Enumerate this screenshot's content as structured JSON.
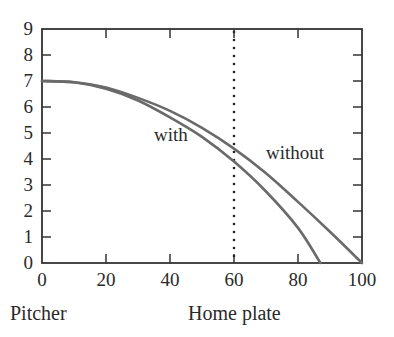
{
  "chart_data": {
    "type": "line",
    "title": "",
    "xlabel": "",
    "ylabel": "",
    "xlim": [
      0,
      100
    ],
    "ylim": [
      0,
      9
    ],
    "grid": false,
    "x_ticks": [
      0,
      20,
      40,
      60,
      80,
      100
    ],
    "y_ticks": [
      0,
      1,
      2,
      3,
      4,
      5,
      6,
      7,
      8,
      9
    ],
    "x_tick_labels": [
      "0",
      "20",
      "40",
      "60",
      "80",
      "100"
    ],
    "y_tick_labels": [
      "0",
      "1",
      "2",
      "3",
      "4",
      "5",
      "6",
      "7",
      "8",
      "9"
    ],
    "series": [
      {
        "name": "with",
        "x": [
          0,
          10,
          20,
          30,
          40,
          50,
          60,
          70,
          80,
          87
        ],
        "y": [
          7.0,
          6.95,
          6.7,
          6.25,
          5.6,
          4.85,
          3.9,
          2.75,
          1.35,
          0.0
        ]
      },
      {
        "name": "without",
        "x": [
          0,
          10,
          20,
          30,
          40,
          50,
          60,
          70,
          80,
          90,
          100
        ],
        "y": [
          7.0,
          6.95,
          6.75,
          6.35,
          5.85,
          5.2,
          4.4,
          3.45,
          2.35,
          1.2,
          0.0
        ]
      }
    ],
    "annotations": [
      {
        "text": "with",
        "x": 35,
        "y": 4.7
      },
      {
        "text": "without",
        "x": 70,
        "y": 4.0
      },
      {
        "type": "vertical-dotted-line",
        "x": 60
      }
    ],
    "captions": {
      "left": "Pitcher",
      "center": "Home plate"
    },
    "line_color": "#6a6a6a"
  }
}
